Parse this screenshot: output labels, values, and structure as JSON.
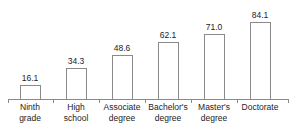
{
  "chart_data": {
    "type": "bar",
    "title": "",
    "subtitle": "",
    "xlabel": "",
    "ylabel": "",
    "ylim": [
      0,
      90
    ],
    "grid": false,
    "legend": null,
    "categories": [
      "Ninth grade",
      "High school",
      "Associate degree",
      "Bachelor's degree",
      "Master's degree",
      "Doctorate"
    ],
    "category_lines": [
      [
        "Ninth",
        "grade"
      ],
      [
        "High",
        "school"
      ],
      [
        "Associate",
        "degree"
      ],
      [
        "Bachelor's",
        "degree"
      ],
      [
        "Master's",
        "degree"
      ],
      [
        "Doctorate",
        ""
      ]
    ],
    "values": [
      16.1,
      34.3,
      48.6,
      62.1,
      71.0,
      84.1
    ],
    "value_labels": [
      "16.1",
      "34.3",
      "48.6",
      "62.1",
      "71.0",
      "84.1"
    ],
    "bar_fill": "#ffffff",
    "bar_stroke": "#8a8a8a",
    "axis_color": "#8a8a8a",
    "text_color": "#1c1c1c",
    "background": "#ffffff"
  },
  "layout": {
    "bar_centers": [
      30,
      76,
      122,
      168,
      214,
      260
    ],
    "tick_positions": [
      8,
      53,
      99,
      145,
      191,
      237,
      288
    ],
    "axis_y": 99,
    "plot_height": 99,
    "px_per_unit": 0.93
  }
}
